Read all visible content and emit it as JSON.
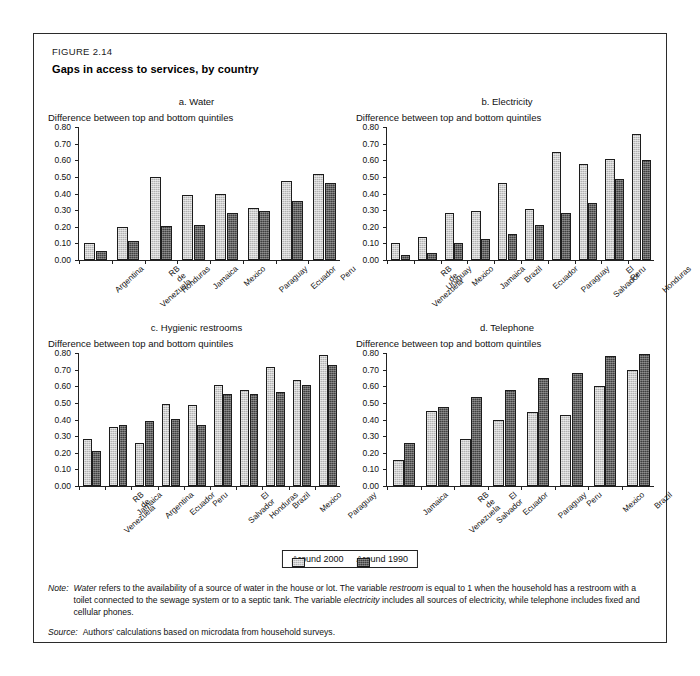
{
  "figure": {
    "number": "FIGURE 2.14",
    "title": "Gaps in access to services, by country"
  },
  "legend": {
    "position": "bottom-center",
    "items": [
      {
        "label": "Around 2000",
        "key": "around_2000",
        "color": "#b3b3b3"
      },
      {
        "label": "Around 1990",
        "key": "around_1990",
        "color": "#404040"
      }
    ]
  },
  "axis": {
    "ylabel": "Difference between top and bottom quintiles",
    "ticks": [
      "0.00",
      "0.10",
      "0.20",
      "0.30",
      "0.40",
      "0.50",
      "0.60",
      "0.70",
      "0.80"
    ],
    "ylim": [
      0,
      0.8
    ]
  },
  "notes": {
    "note_label": "Note:",
    "note_text_1": "Water",
    "note_text_2": " refers to the availability of a source of water in the house or lot. The variable ",
    "note_text_3": "restroom",
    "note_text_4": " is equal to 1 when the household has a restroom with a toilet connected to the sewage system or to a septic tank. The variable ",
    "note_text_5": "electricity",
    "note_text_6": " includes all sources of electricity, while telephone includes fixed and cellular phones.",
    "source_label": "Source:",
    "source_text": "Authors' calculations based on microdata from household surveys."
  },
  "chart_data": [
    {
      "id": "a",
      "type": "bar",
      "title": "a. Water",
      "xlabel": "",
      "ylabel": "Difference between top and bottom quintiles",
      "ylim": [
        0,
        0.8
      ],
      "yticks": [
        0.0,
        0.1,
        0.2,
        0.3,
        0.4,
        0.5,
        0.6,
        0.7,
        0.8
      ],
      "grid": false,
      "legend": [
        "Around 2000",
        "Around 1990"
      ],
      "categories": [
        "Argentina",
        "RB de Venezuela",
        "Honduras",
        "Jamaica",
        "Mexico",
        "Paraguay",
        "Ecuador",
        "Peru"
      ],
      "series": [
        {
          "name": "Around 2000",
          "values": [
            0.1,
            0.2,
            0.5,
            0.39,
            0.4,
            0.315,
            0.475,
            0.52
          ]
        },
        {
          "name": "Around 1990",
          "values": [
            0.055,
            0.115,
            0.205,
            0.21,
            0.28,
            0.295,
            0.355,
            0.465
          ]
        }
      ]
    },
    {
      "id": "b",
      "type": "bar",
      "title": "b. Electricity",
      "xlabel": "",
      "ylabel": "Difference between top and bottom quintiles",
      "ylim": [
        0,
        0.8
      ],
      "yticks": [
        0.0,
        0.1,
        0.2,
        0.3,
        0.4,
        0.5,
        0.6,
        0.7,
        0.8
      ],
      "grid": false,
      "legend": [
        "Around 2000",
        "Around 1990"
      ],
      "categories": [
        "RB de Venezuela",
        "Uruguay",
        "Mexico",
        "Jamaica",
        "Brazil",
        "Ecuador",
        "Paraguay",
        "El Salvador",
        "Peru",
        "Honduras"
      ],
      "series": [
        {
          "name": "Around 2000",
          "values": [
            0.1,
            0.14,
            0.285,
            0.295,
            0.465,
            0.305,
            0.65,
            0.575,
            0.61,
            0.76
          ]
        },
        {
          "name": "Around 1990",
          "values": [
            0.03,
            0.04,
            0.1,
            0.125,
            0.155,
            0.21,
            0.28,
            0.345,
            0.485,
            0.6
          ]
        }
      ]
    },
    {
      "id": "c",
      "type": "bar",
      "title": "c. Hygienic restrooms",
      "xlabel": "",
      "ylabel": "Difference between top and bottom quintiles",
      "ylim": [
        0,
        0.8
      ],
      "yticks": [
        0.0,
        0.1,
        0.2,
        0.3,
        0.4,
        0.5,
        0.6,
        0.7,
        0.8
      ],
      "grid": false,
      "legend": [
        "Around 2000",
        "Around 1990"
      ],
      "categories": [
        "RB de Venezuela",
        "Jamaica",
        "Argentina",
        "Ecuador",
        "Peru",
        "El Salvador",
        "Honduras",
        "Brazil",
        "Mexico",
        "Paraguay"
      ],
      "series": [
        {
          "name": "Around 2000",
          "values": [
            0.285,
            0.355,
            0.26,
            0.495,
            0.49,
            0.605,
            0.58,
            0.715,
            0.64,
            0.79
          ]
        },
        {
          "name": "Around 1990",
          "values": [
            0.21,
            0.365,
            0.39,
            0.405,
            0.37,
            0.555,
            0.555,
            0.565,
            0.605,
            0.725
          ]
        }
      ]
    },
    {
      "id": "d",
      "type": "bar",
      "title": "d. Telephone",
      "xlabel": "",
      "ylabel": "Difference between top and bottom quintiles",
      "ylim": [
        0,
        0.8
      ],
      "yticks": [
        0.0,
        0.1,
        0.2,
        0.3,
        0.4,
        0.5,
        0.6,
        0.7,
        0.8
      ],
      "grid": false,
      "legend": [
        "Around 2000",
        "Around 1990"
      ],
      "categories": [
        "Jamaica",
        "RB de Venezuela",
        "El Salvador",
        "Ecuador",
        "Paraguay",
        "Peru",
        "Mexico",
        "Brazil"
      ],
      "series": [
        {
          "name": "Around 2000",
          "values": [
            0.155,
            0.45,
            0.28,
            0.4,
            0.445,
            0.425,
            0.6,
            0.7
          ]
        },
        {
          "name": "Around 1990",
          "values": [
            0.26,
            0.475,
            0.535,
            0.575,
            0.65,
            0.68,
            0.78,
            0.795
          ]
        }
      ]
    }
  ]
}
